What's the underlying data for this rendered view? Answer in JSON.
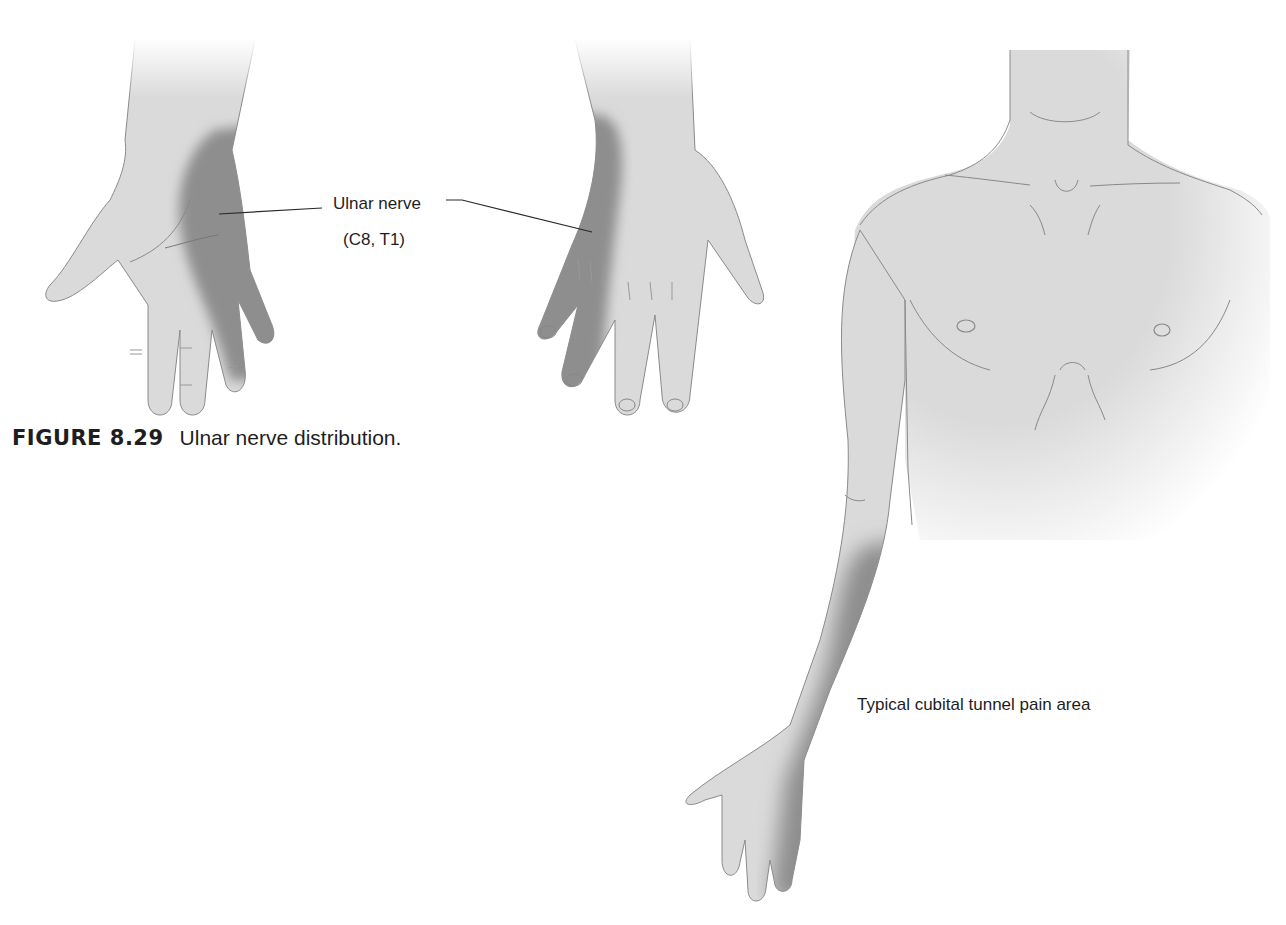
{
  "figure": {
    "number": "FIGURE 8.29",
    "caption": "Ulnar nerve distribution."
  },
  "labels": {
    "nerve_name": "Ulnar nerve",
    "nerve_roots": "(C8, T1)",
    "pain_area": "Typical cubital tunnel pain area"
  },
  "illustrations": [
    {
      "name": "palmar-hand",
      "shaded_region": "ulnar side of palm, ring and little fingers"
    },
    {
      "name": "dorsal-hand",
      "shaded_region": "ulnar side of dorsum, ring and little fingers"
    },
    {
      "name": "torso-and-arm",
      "shaded_region": "medial forearm to ulnar hand"
    }
  ],
  "colors": {
    "skin": "#dadada",
    "shade": "#8e8e8e",
    "outline": "#8a8a8a",
    "text": "#1e1e1e",
    "background": "#ffffff"
  }
}
